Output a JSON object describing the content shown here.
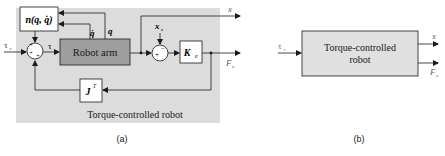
{
  "figure_a": {
    "caption": "(a)",
    "panel_label": "Torque-controlled robot",
    "blocks": {
      "nonlinear": "n(q, q̇)",
      "robot_arm": "Robot arm",
      "stiffness": "K",
      "stiffness_sub": "e",
      "jacobian": "J",
      "jacobian_sup": "T"
    },
    "signals": {
      "input_tau": "τ",
      "input_tau_sub": "r",
      "tau": "τ",
      "q_dot": "q̇",
      "q": "q",
      "x_e": "x",
      "x_e_sub": "e",
      "output_x": "x",
      "output_F": "F",
      "output_F_sub": "e"
    },
    "junctions": {
      "sum1_signs": [
        "+",
        "+",
        "+"
      ],
      "sum2_signs": [
        "+",
        "−"
      ]
    }
  },
  "figure_b": {
    "caption": "(b)",
    "block_line1": "Torque-controlled",
    "block_line2": "robot",
    "input_tau": "τ",
    "input_tau_sub": "r",
    "output_x": "x",
    "output_F": "F",
    "output_F_sub": "e"
  },
  "colors": {
    "panel_bg": "#dcdcdc",
    "robot_arm_fill": "#9e9e9e",
    "box_fill": "#ffffff",
    "line": "#1a1a1a",
    "block_b_fill": "#e0e0e0"
  }
}
